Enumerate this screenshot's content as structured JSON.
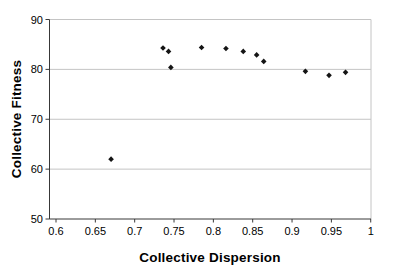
{
  "chart_data": {
    "type": "scatter",
    "xlabel": "Collective Dispersion",
    "ylabel": "Collective Fitness",
    "xlim": [
      0.6,
      1.0
    ],
    "ylim": [
      50,
      90
    ],
    "x_ticks": [
      0.6,
      0.65,
      0.7,
      0.75,
      0.8,
      0.85,
      0.9,
      0.95,
      1
    ],
    "x_tick_labels": [
      "0.6",
      "0.65",
      "0.7",
      "0.75",
      "0.8",
      "0.85",
      "0.9",
      "0.95",
      "1"
    ],
    "y_ticks": [
      90,
      80,
      70,
      60,
      50
    ],
    "y_tick_labels": [
      "90",
      "80",
      "70",
      "60",
      "50"
    ],
    "grid": "horizontal",
    "legend": "none",
    "marker": "diamond",
    "points": [
      {
        "x": 0.67,
        "y": 62.0
      },
      {
        "x": 0.736,
        "y": 84.3
      },
      {
        "x": 0.743,
        "y": 83.6
      },
      {
        "x": 0.746,
        "y": 80.4
      },
      {
        "x": 0.785,
        "y": 84.4
      },
      {
        "x": 0.816,
        "y": 84.2
      },
      {
        "x": 0.838,
        "y": 83.6
      },
      {
        "x": 0.855,
        "y": 82.9
      },
      {
        "x": 0.864,
        "y": 81.6
      },
      {
        "x": 0.917,
        "y": 79.6
      },
      {
        "x": 0.947,
        "y": 78.8
      },
      {
        "x": 0.968,
        "y": 79.4
      }
    ],
    "colors": {
      "marker": "#141414",
      "gridline": "#c4c4c4",
      "axis": "#383838",
      "text": "#000000",
      "background": "#ffffff"
    }
  }
}
